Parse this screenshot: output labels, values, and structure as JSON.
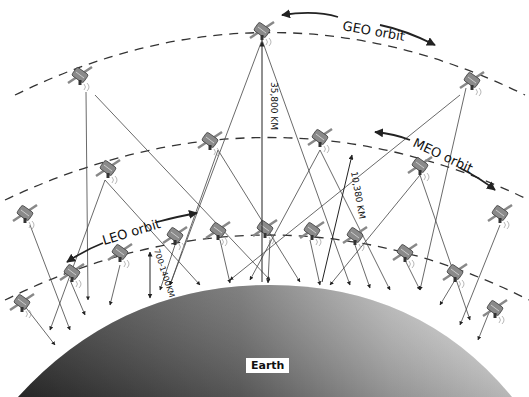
{
  "diagram": {
    "orbits": [
      {
        "name": "GEO",
        "label": "GEO orbit",
        "altitude_label": "35,800 KM"
      },
      {
        "name": "MEO",
        "label": "MEO orbit",
        "altitude_label": "10,380 KM"
      },
      {
        "name": "LEO",
        "label": "LEO orbit",
        "altitude_label": "700-1400KM"
      }
    ],
    "earth_label": "Earth",
    "colors": {
      "earth_dark": "#3a3a3a",
      "earth_light": "#d8d8d8",
      "orbit_dash": "#333333",
      "line": "#444444",
      "satellite": "#777777"
    }
  }
}
